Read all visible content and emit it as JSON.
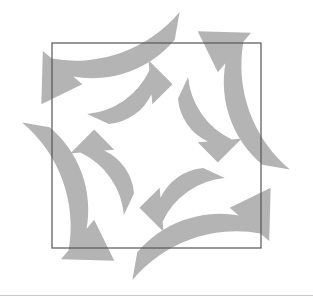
{
  "canvas": {
    "width": 313,
    "height": 300,
    "background_color": "#ffffff"
  },
  "figure": {
    "title": "",
    "arrow_fill_color": "#b4b4b4",
    "square_stroke_color": "#555555"
  },
  "square_overlay": {
    "name": "square-outline",
    "x": 52,
    "y": 43,
    "width": 209,
    "height": 205,
    "stroke_width": 1.2
  },
  "bottom_rule": {
    "color": "#9a9a9a",
    "y": 295
  },
  "rings": [
    {
      "name": "outer-ring",
      "direction": "counter-clockwise",
      "center_x": 156,
      "center_y": 146,
      "inner_radius": 108,
      "outer_radius": 136,
      "segment_count": 4,
      "segments": [
        {
          "name": "outer-arrow-top-left",
          "label": "top-left",
          "start_angle": 200,
          "end_angle": 280
        },
        {
          "name": "outer-arrow-top-right",
          "label": "top-right",
          "start_angle": 290,
          "end_angle": 370
        },
        {
          "name": "outer-arrow-bottom-right",
          "label": "bottom-right",
          "start_angle": 20,
          "end_angle": 100
        },
        {
          "name": "outer-arrow-bottom-left",
          "label": "bottom-left",
          "start_angle": 110,
          "end_angle": 190
        }
      ]
    },
    {
      "name": "inner-ring",
      "direction": "clockwise",
      "center_x": 156,
      "center_y": 146,
      "inner_radius": 52,
      "outer_radius": 76,
      "segment_count": 4,
      "segments": [
        {
          "name": "inner-arrow-top",
          "label": "top",
          "start_angle": 205,
          "end_angle": 285
        },
        {
          "name": "inner-arrow-right",
          "label": "right",
          "start_angle": 295,
          "end_angle": 375
        },
        {
          "name": "inner-arrow-bottom",
          "label": "bottom",
          "start_angle": 25,
          "end_angle": 105
        },
        {
          "name": "inner-arrow-left",
          "label": "left",
          "start_angle": 115,
          "end_angle": 195
        }
      ]
    }
  ],
  "labels": {
    "figure_caption": "",
    "alt_text": "Circular process diagram: eight curved arrows in two concentric rings inside a square frame"
  }
}
